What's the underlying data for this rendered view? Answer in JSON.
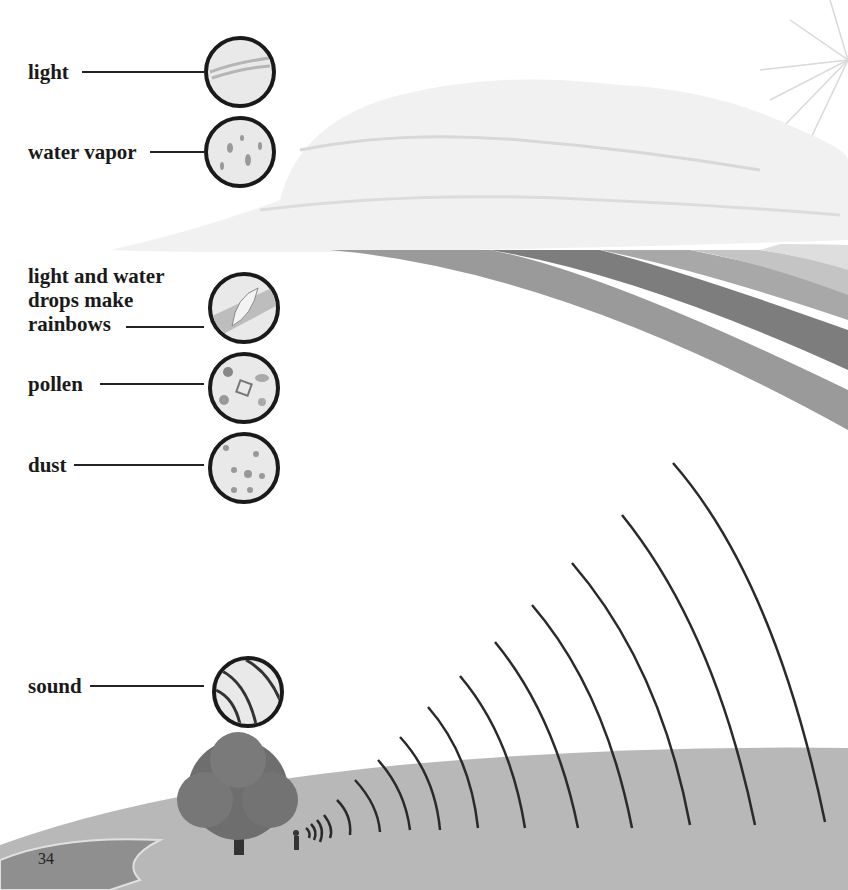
{
  "page_number": "34",
  "labels": [
    {
      "id": "light",
      "text": "light",
      "icon": "light-rays-icon"
    },
    {
      "id": "water-vapor",
      "text": "water vapor",
      "icon": "water-droplets-icon"
    },
    {
      "id": "rainbows",
      "lines": [
        "light and water",
        "drops make",
        "rainbows"
      ],
      "icon": "rainbow-drop-icon"
    },
    {
      "id": "pollen",
      "text": "pollen",
      "icon": "pollen-grains-icon"
    },
    {
      "id": "dust",
      "text": "dust",
      "icon": "dust-particles-icon"
    },
    {
      "id": "sound",
      "text": "sound",
      "icon": "sound-waves-icon"
    }
  ],
  "scene": {
    "elements": [
      "clouds",
      "sun-rays",
      "rainbow",
      "hill",
      "tree",
      "pond",
      "person",
      "sound-waves"
    ]
  }
}
